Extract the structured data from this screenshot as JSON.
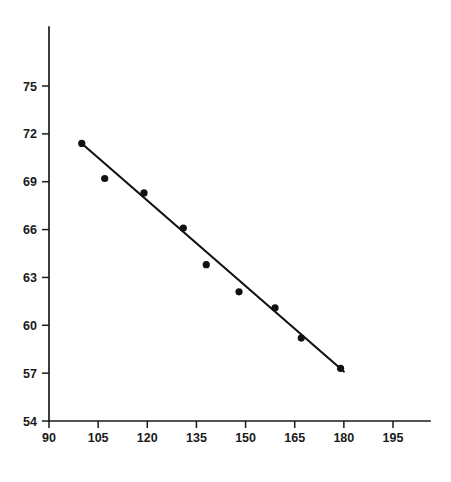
{
  "chart_data": {
    "type": "scatter",
    "title": "",
    "subtitle": "",
    "xlabel": "",
    "ylabel": "",
    "xlim": [
      90,
      200
    ],
    "ylim": [
      54,
      77
    ],
    "xticks": [
      90,
      105,
      120,
      135,
      150,
      165,
      180,
      195
    ],
    "yticks": [
      54,
      57,
      60,
      63,
      66,
      69,
      72,
      75
    ],
    "xtick_labels": [
      "90",
      "105",
      "120",
      "135",
      "150",
      "165",
      "180",
      "195"
    ],
    "ytick_labels": [
      "54",
      "57",
      "60",
      "63",
      "66",
      "69",
      "72",
      "75"
    ],
    "grid": false,
    "legend": false,
    "legend_position": "none",
    "point_color": "#111111",
    "line_color": "#111111",
    "axis_color": "#1a1a1a",
    "background_color": "#ffffff",
    "series": [
      {
        "name": "observations",
        "type": "scatter",
        "marker": "filled-circle",
        "x": [
          100,
          107,
          119,
          131,
          138,
          148,
          159,
          167,
          179
        ],
        "y": [
          71.4,
          69.2,
          68.3,
          66.1,
          63.8,
          62.1,
          61.1,
          59.2,
          57.3
        ]
      },
      {
        "name": "regression-line",
        "type": "line",
        "x": [
          100,
          180
        ],
        "y": [
          71.4,
          57.1
        ]
      }
    ]
  },
  "axes": {
    "x_axis_name": "x-axis",
    "y_axis_name": "y-axis"
  }
}
